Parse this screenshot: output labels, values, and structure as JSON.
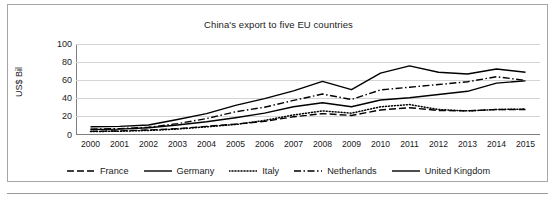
{
  "chart_data": {
    "type": "line",
    "title": "China's export to five EU countries",
    "xlabel": "",
    "ylabel": "US$ Bil",
    "ylim": [
      0,
      100
    ],
    "yticks": [
      0,
      20,
      40,
      60,
      80,
      100
    ],
    "grid": true,
    "legend_position": "bottom",
    "categories": [
      "2000",
      "2001",
      "2002",
      "2003",
      "2004",
      "2005",
      "2006",
      "2007",
      "2008",
      "2009",
      "2010",
      "2011",
      "2012",
      "2013",
      "2014",
      "2015"
    ],
    "series": [
      {
        "name": "France",
        "style": "dashed",
        "values": [
          4.0,
          4.5,
          5.5,
          7.0,
          9.5,
          12.0,
          15.0,
          20.0,
          23.5,
          21.5,
          27.5,
          30.0,
          27.0,
          26.5,
          28.0,
          28.0
        ]
      },
      {
        "name": "Germany",
        "style": "solid",
        "values": [
          9.0,
          9.5,
          11.0,
          17.0,
          23.5,
          32.5,
          40.0,
          48.5,
          59.0,
          49.8,
          68.0,
          76.0,
          69.0,
          67.0,
          72.5,
          69.0
        ]
      },
      {
        "name": "Italy",
        "style": "dotted",
        "values": [
          3.8,
          4.2,
          5.0,
          6.5,
          9.0,
          11.5,
          16.0,
          22.0,
          26.5,
          24.0,
          31.0,
          33.5,
          28.0,
          26.5,
          28.0,
          28.5
        ]
      },
      {
        "name": "Netherlands",
        "style": "dash-dot",
        "values": [
          6.5,
          7.0,
          8.5,
          12.5,
          18.0,
          25.5,
          30.5,
          38.0,
          45.0,
          39.0,
          49.5,
          52.5,
          55.5,
          58.5,
          64.0,
          60.0
        ]
      },
      {
        "name": "United Kingdom",
        "style": "solid",
        "values": [
          6.0,
          6.5,
          8.0,
          11.0,
          14.5,
          19.0,
          24.0,
          31.0,
          35.5,
          31.0,
          38.5,
          41.0,
          44.5,
          48.0,
          57.0,
          59.5
        ]
      }
    ]
  },
  "legend": {
    "items": [
      {
        "label": "France",
        "swatch": "dashed-line-swatch"
      },
      {
        "label": "Germany",
        "swatch": "solid-line-swatch"
      },
      {
        "label": "Italy",
        "swatch": "dotted-line-swatch"
      },
      {
        "label": "Netherlands",
        "swatch": "dash-dot-line-swatch"
      },
      {
        "label": "United Kingdom",
        "swatch": "solid-line-swatch"
      }
    ]
  },
  "colors": {
    "line": "#000000",
    "gridline": "#d4d4d4",
    "axis": "#7f7f7f",
    "frame_border": "#a6a6a6",
    "text": "#1a1a1a",
    "background": "#ffffff"
  }
}
